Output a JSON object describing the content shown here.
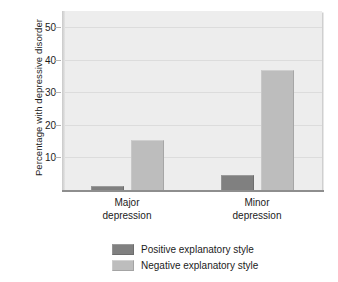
{
  "chart_data": {
    "type": "bar",
    "title": "",
    "xlabel": "",
    "ylabel": "Percentage with depressive disorder",
    "categories": [
      "Major depression",
      "Minor depression"
    ],
    "category_lines": [
      [
        "Major",
        "depression"
      ],
      [
        "Minor",
        "depression"
      ]
    ],
    "series": [
      {
        "name": "Positive explanatory style",
        "color": "#808080",
        "values": [
          1.3,
          4.6
        ]
      },
      {
        "name": "Negative explanatory style",
        "color": "#bdbdbd",
        "values": [
          15.5,
          37.0
        ]
      }
    ],
    "ylim": [
      0,
      55
    ],
    "yticks": [
      10,
      20,
      30,
      40,
      50
    ],
    "ytick_labels": [
      "10",
      "20",
      "30",
      "40",
      "50"
    ],
    "grid": true,
    "legend_position": "bottom",
    "plot_background": "#ededed"
  },
  "legend": {
    "items": [
      {
        "label": "Positive explanatory style",
        "swatch": "dark"
      },
      {
        "label": "Negative explanatory style",
        "swatch": "light"
      }
    ]
  }
}
